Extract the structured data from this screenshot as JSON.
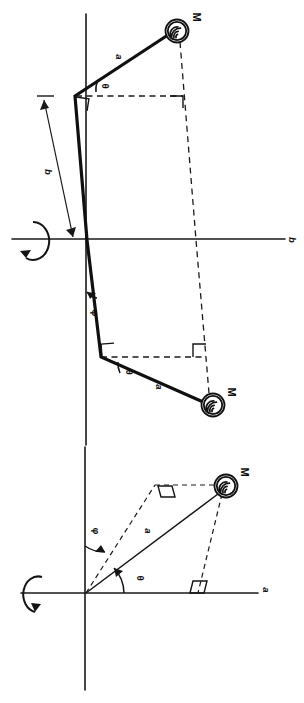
{
  "figure": {
    "orientation": "landscape-content-rotated-90",
    "background_color": "#ffffff",
    "ink_color": "#101010",
    "panels": [
      {
        "id": "panel-upper",
        "name": "bent-rod-double-mass-diagram",
        "description": "Vertical spin axis with a bent (elbow) rod carrying a mass at each end; dashed construction lines and right-angle markers",
        "axis_label_horizontal": "b",
        "labels": {
          "mass_top": "M",
          "mass_bottom": "M",
          "arm_top": "a",
          "arm_bottom": "a",
          "offset": "b",
          "angle_top": "θ",
          "angle_bottom": "θ",
          "angle_tilt": "φ"
        }
      },
      {
        "id": "panel-lower",
        "name": "single-rod-mass-diagram",
        "description": "Vertical spin axis with one straight rod to a single mass; dashed parallelogram construction with right-angle markers",
        "axis_label_horizontal": "a",
        "labels": {
          "mass": "M",
          "arm": "a",
          "angle_from_horizontal": "θ",
          "angle_from_vertical": "φ"
        }
      }
    ],
    "symbols": {
      "mass_glyph": "hatched-circle",
      "rotation_glyph": "curved-arrow-about-axis",
      "right_angle_glyph": "square-corner-marker"
    }
  }
}
